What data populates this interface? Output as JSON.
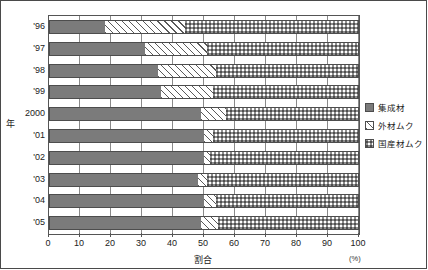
{
  "chart_data": {
    "type": "bar",
    "orientation": "horizontal",
    "stacked": true,
    "stack_total": 100,
    "title": "",
    "xlabel": "割合",
    "xunit": "(%)",
    "ylabel": "年",
    "xlim": [
      0,
      100
    ],
    "xticks": [
      0,
      10,
      20,
      30,
      40,
      50,
      60,
      70,
      80,
      90,
      100
    ],
    "xtick_labels": [
      "0",
      "10",
      "20",
      "30",
      "40",
      "50",
      "60",
      "70",
      "80",
      "90",
      "100"
    ],
    "grid": true,
    "grid_axis": "x",
    "legend_position": "right",
    "categories": [
      "'96",
      "'97",
      "'98",
      "'99",
      "2000",
      "'01",
      "'02",
      "'03",
      "'04",
      "'05"
    ],
    "series": [
      {
        "name": "集成材",
        "fill": "solid-gray",
        "color": "#7b7b7b",
        "values": [
          18,
          31,
          35,
          36,
          49,
          50,
          50,
          48,
          50,
          49
        ]
      },
      {
        "name": "外材ムク",
        "fill": "diagonal-hatch",
        "color": "#ffffff",
        "values": [
          26,
          20,
          19,
          17,
          8,
          3,
          2,
          3,
          4,
          5.5
        ]
      },
      {
        "name": "国産材ムク",
        "fill": "checker-dots",
        "color": "#c9c9c9",
        "values": [
          56,
          49,
          46,
          47,
          43,
          47,
          48,
          49,
          46,
          45.5
        ]
      }
    ]
  },
  "legend": {
    "items": [
      {
        "label": "集成材"
      },
      {
        "label": "外材ムク"
      },
      {
        "label": "国産材ムク"
      }
    ]
  },
  "axes": {
    "y_title": "年",
    "x_title": "割合",
    "x_unit": "(%)"
  }
}
